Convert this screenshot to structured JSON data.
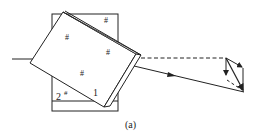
{
  "figure": {
    "caption": "(a)",
    "labels": {
      "face_1": "1",
      "face_2": "2",
      "sharp_mark": "#"
    },
    "elements": [
      "incident-ray",
      "back-rectangle-prism",
      "tilted-prism-plate",
      "refracted-ray",
      "dashed-reference-ray",
      "vector-triangle"
    ],
    "colors": {
      "line": "#222222",
      "background": "#ffffff"
    }
  }
}
